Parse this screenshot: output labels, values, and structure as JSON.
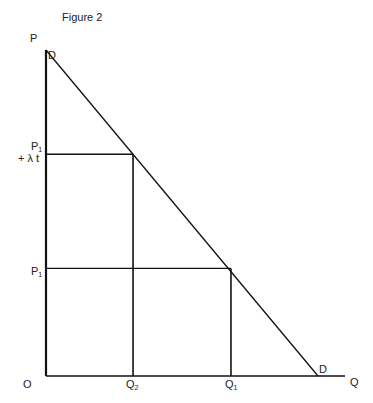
{
  "figure": {
    "title": "Figure 2",
    "axes": {
      "y_label": "P",
      "x_label": "Q",
      "origin_label": "O"
    },
    "demand_curve": {
      "label_top": "D",
      "label_bottom": "D"
    },
    "price_levels": [
      {
        "label_main": "P1",
        "label_main_base": "P",
        "label_main_sub": "1",
        "label_extra": "+ λ t",
        "name": "price-with-tax"
      },
      {
        "label_main": "P1",
        "label_main_base": "P",
        "label_main_sub": "1",
        "label_extra": "",
        "name": "price-base"
      }
    ],
    "quantity_levels": [
      {
        "label": "Q2",
        "label_base": "Q",
        "label_sub": "2"
      },
      {
        "label": "Q1",
        "label_base": "Q",
        "label_sub": "1"
      }
    ]
  },
  "chart_data": {
    "type": "line",
    "title": "Figure 2",
    "xlabel": "Q",
    "ylabel": "P",
    "series": [
      {
        "name": "D",
        "points": [
          [
            0,
            1.0
          ],
          [
            1.0,
            0
          ]
        ]
      }
    ],
    "reference_points": [
      {
        "price_label": "P1 + λt",
        "quantity_label": "Q2",
        "price": 0.68,
        "quantity": 0.32
      },
      {
        "price_label": "P1",
        "quantity_label": "Q1",
        "price": 0.33,
        "quantity": 0.68
      }
    ],
    "grid": false,
    "legend": "none"
  }
}
